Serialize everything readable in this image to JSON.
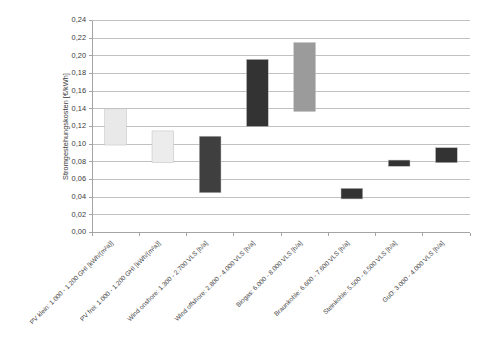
{
  "chart_data": {
    "type": "bar",
    "bar_style": "floating-range",
    "title": "",
    "subtitle": "",
    "xlabel": "",
    "ylabel": "Stromgestehungskosten [€/kWh]",
    "ylim": [
      0.0,
      0.24
    ],
    "ytick_step": 0.02,
    "grid": true,
    "grid_axis": "y",
    "legend": false,
    "legend_position": "none",
    "decimal_separator": ",",
    "ytick_labels": [
      "0,00",
      "0,02",
      "0,04",
      "0,06",
      "0,08",
      "0,10",
      "0,12",
      "0,14",
      "0,16",
      "0,18",
      "0,20",
      "0,22",
      "0,24"
    ],
    "ytick_values": [
      0.0,
      0.02,
      0.04,
      0.06,
      0.08,
      0.1,
      0.12,
      0.14,
      0.16,
      0.18,
      0.2,
      0.22,
      0.24
    ],
    "categories": [
      "PV klein: 1.000 - 1.200 GHI [kWh/(m²a)]",
      "PV frei: 1.000 - 1.200 GHI [kWh/(m²a)]",
      "Wind onshore: 1.300 - 2.700 VLS [h/a]",
      "Wind offshore: 2.800 - 4.000 VLS [h/a]",
      "Biogas: 6.000 - 8.000 VLS [h/a]",
      "Braunkohle: 6.600 - 7.600 VLS [h/a]",
      "Steinkohle: 5.500 - 6.500 VLS [h/a]",
      "GuD: 3.000 - 4.000 VLS [h/a]"
    ],
    "series": [
      {
        "name": "Stromgestehungskosten Bandbreite",
        "low": [
          0.099,
          0.079,
          0.045,
          0.12,
          0.137,
          0.038,
          0.075,
          0.079
        ],
        "high": [
          0.14,
          0.115,
          0.109,
          0.196,
          0.215,
          0.05,
          0.082,
          0.096
        ],
        "colors": [
          "#e9e9e9",
          "#ececec",
          "#3f3f3f",
          "#333333",
          "#9b9b9b",
          "#333333",
          "#333333",
          "#333333"
        ]
      }
    ],
    "bars": [
      {
        "category": "PV klein: 1.000 - 1.200 GHI [kWh/(m²a)]",
        "low": 0.099,
        "high": 0.14,
        "color": "#e9e9e9"
      },
      {
        "category": "PV frei: 1.000 - 1.200 GHI [kWh/(m²a)]",
        "low": 0.079,
        "high": 0.115,
        "color": "#ececec"
      },
      {
        "category": "Wind onshore: 1.300 - 2.700 VLS [h/a]",
        "low": 0.045,
        "high": 0.109,
        "color": "#3f3f3f"
      },
      {
        "category": "Wind offshore: 2.800 - 4.000 VLS [h/a]",
        "low": 0.12,
        "high": 0.196,
        "color": "#333333"
      },
      {
        "category": "Biogas: 6.000 - 8.000 VLS [h/a]",
        "low": 0.137,
        "high": 0.215,
        "color": "#9b9b9b"
      },
      {
        "category": "Braunkohle: 6.600 - 7.600 VLS [h/a]",
        "low": 0.038,
        "high": 0.05,
        "color": "#333333"
      },
      {
        "category": "Steinkohle: 5.500 - 6.500 VLS [h/a]",
        "low": 0.075,
        "high": 0.082,
        "color": "#333333"
      },
      {
        "category": "GuD: 3.000 - 4.000 VLS [h/a]",
        "low": 0.079,
        "high": 0.096,
        "color": "#333333"
      }
    ],
    "colors": {
      "background": "#ffffff",
      "gridline": "#a6a6a6",
      "axis": "#9a9a9a",
      "text": "#3a3a3a"
    }
  }
}
